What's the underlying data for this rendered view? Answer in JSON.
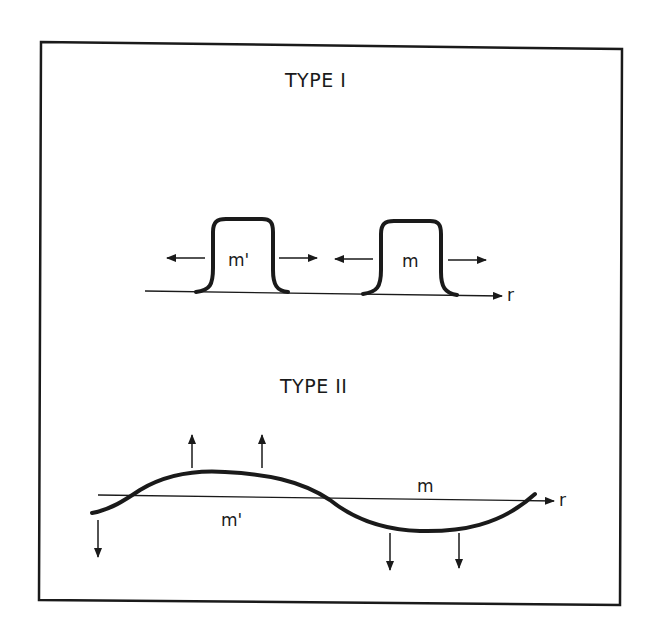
{
  "figure": {
    "panels": [
      {
        "title": "TYPE I",
        "description": "Two rectangular pulses on the r axis spreading outward",
        "labels": [
          "m'",
          "m"
        ],
        "axis_label": "r"
      },
      {
        "title": "TYPE II",
        "description": "Sinusoidal perturbation crossing the r axis with vertical growth arrows",
        "labels": [
          "m",
          "m'"
        ],
        "axis_label": "r"
      }
    ]
  },
  "colors": {
    "ink": "#1a1a1a",
    "background": "#ffffff"
  }
}
